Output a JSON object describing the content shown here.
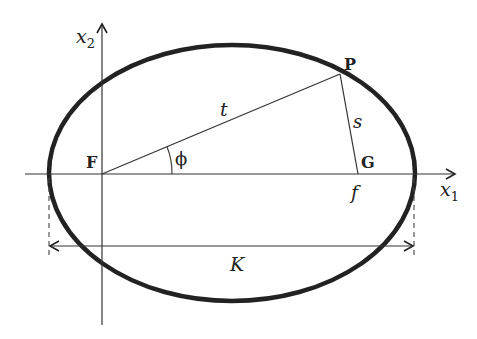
{
  "diagram": {
    "type": "ellipse-focal-geometry",
    "colors": {
      "ink": "#222222",
      "background": "#ffffff"
    },
    "axes": {
      "x1_label": "x",
      "x1_subscript": "1",
      "x2_label": "x",
      "x2_subscript": "2"
    },
    "points": {
      "F": "F",
      "P": "P",
      "G": "G"
    },
    "segments": {
      "FP": "t",
      "PG": "s"
    },
    "angle_label": "ϕ",
    "focal_distance_label": "f",
    "width_label": "K"
  }
}
